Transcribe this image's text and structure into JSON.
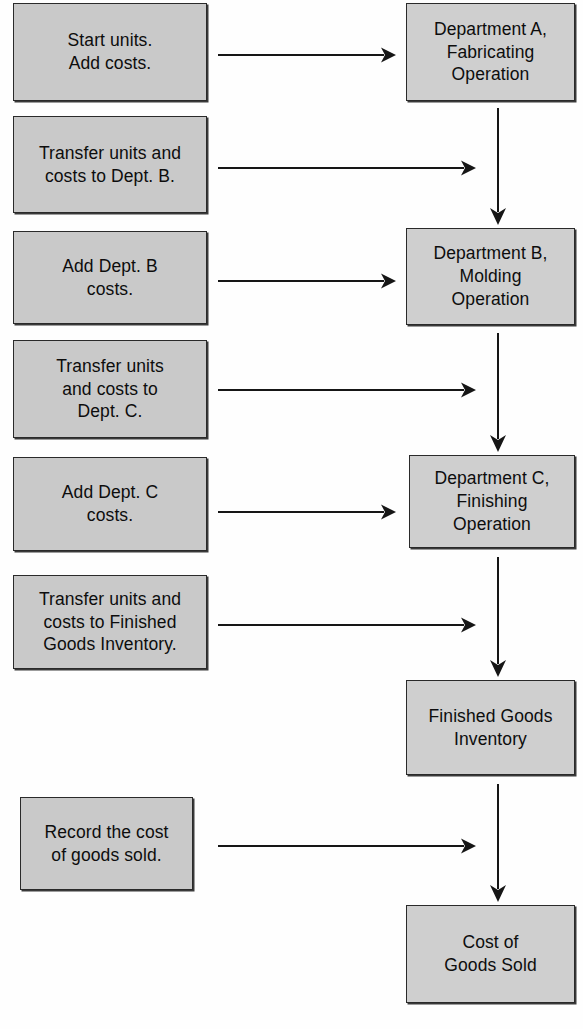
{
  "diagram": {
    "colors": {
      "box_fill": "#c9c9c9",
      "box_fill_light": "#cfcfcf",
      "box_border": "#2a2a2a",
      "arrow": "#161616",
      "text": "#0d0d0d",
      "background": "#ffffff"
    },
    "left_boxes": [
      {
        "id": "start-units-add-costs",
        "text": "Start units.\nAdd costs.",
        "x": 13,
        "y": 3,
        "w": 194,
        "h": 98
      },
      {
        "id": "transfer-to-dept-b",
        "text": "Transfer units and\ncosts to Dept.  B.",
        "x": 13,
        "y": 116,
        "w": 194,
        "h": 97
      },
      {
        "id": "add-dept-b-costs",
        "text": "Add Dept.  B\ncosts.",
        "x": 13,
        "y": 231,
        "w": 194,
        "h": 93
      },
      {
        "id": "transfer-to-dept-c",
        "text": "Transfer units\nand costs to\nDept.  C.",
        "x": 13,
        "y": 340,
        "w": 194,
        "h": 98
      },
      {
        "id": "add-dept-c-costs",
        "text": "Add Dept.  C\ncosts.",
        "x": 13,
        "y": 457,
        "w": 194,
        "h": 94
      },
      {
        "id": "transfer-to-finished-goods",
        "text": "Transfer units and\ncosts to Finished\nGoods Inventory.",
        "x": 13,
        "y": 575,
        "w": 194,
        "h": 94
      },
      {
        "id": "record-cost-of-goods-sold",
        "text": "Record the cost\nof goods sold.",
        "x": 20,
        "y": 797,
        "w": 173,
        "h": 93
      }
    ],
    "right_boxes": [
      {
        "id": "department-a-fabricating",
        "text": "Department A,\nFabricating\nOperation",
        "x": 406,
        "y": 3,
        "w": 169,
        "h": 98
      },
      {
        "id": "department-b-molding",
        "text": "Department B,\nMolding\nOperation",
        "x": 406,
        "y": 228,
        "w": 169,
        "h": 97
      },
      {
        "id": "department-c-finishing",
        "text": "Department C,\nFinishing\nOperation",
        "x": 409,
        "y": 455,
        "w": 166,
        "h": 93
      },
      {
        "id": "finished-goods-inventory",
        "text": "Finished Goods\nInventory",
        "x": 406,
        "y": 680,
        "w": 169,
        "h": 95
      },
      {
        "id": "cost-of-goods-sold",
        "text": "Cost of\nGoods Sold",
        "x": 406,
        "y": 905,
        "w": 169,
        "h": 98
      }
    ],
    "horizontal_arrows": [
      {
        "id": "arrow-start-to-dept-a",
        "from": "start-units-add-costs",
        "to": "department-a-fabricating",
        "x1": 218,
        "x2": 396,
        "y": 55
      },
      {
        "id": "arrow-transfer-b-to-flow",
        "from": "transfer-to-dept-b",
        "to": "flow-a-to-b",
        "x1": 218,
        "x2": 476,
        "y": 168
      },
      {
        "id": "arrow-add-b-to-dept-b",
        "from": "add-dept-b-costs",
        "to": "department-b-molding",
        "x1": 218,
        "x2": 396,
        "y": 281
      },
      {
        "id": "arrow-transfer-c-to-flow",
        "from": "transfer-to-dept-c",
        "to": "flow-b-to-c",
        "x1": 218,
        "x2": 476,
        "y": 390
      },
      {
        "id": "arrow-add-c-to-dept-c",
        "from": "add-dept-c-costs",
        "to": "department-c-finishing",
        "x1": 218,
        "x2": 396,
        "y": 512
      },
      {
        "id": "arrow-transfer-fg-to-flow",
        "from": "transfer-to-finished-goods",
        "to": "flow-c-to-fg",
        "x1": 218,
        "x2": 476,
        "y": 625
      },
      {
        "id": "arrow-record-cogs-to-flow",
        "from": "record-cost-of-goods-sold",
        "to": "flow-fg-to-cogs",
        "x1": 218,
        "x2": 476,
        "y": 846
      }
    ],
    "vertical_arrows": [
      {
        "id": "flow-a-to-b",
        "from": "department-a-fabricating",
        "to": "department-b-molding",
        "x": 498,
        "y1": 108,
        "y2": 225
      },
      {
        "id": "flow-b-to-c",
        "from": "department-b-molding",
        "to": "department-c-finishing",
        "x": 498,
        "y1": 333,
        "y2": 452
      },
      {
        "id": "flow-c-to-fg",
        "from": "department-c-finishing",
        "to": "finished-goods-inventory",
        "x": 498,
        "y1": 557,
        "y2": 677
      },
      {
        "id": "flow-fg-to-cogs",
        "from": "finished-goods-inventory",
        "to": "cost-of-goods-sold",
        "x": 498,
        "y1": 784,
        "y2": 902
      }
    ]
  }
}
